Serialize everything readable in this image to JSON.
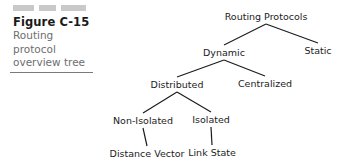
{
  "figure": {
    "title": "Figure C-15",
    "caption_lines": [
      "Routing",
      "protocol",
      "overview tree"
    ],
    "decor_bars": 3,
    "title_color": "#1a1a1a",
    "caption_color": "#6e6e6e",
    "bar_color": "#c9c9c9",
    "rule_color": "#7a7a7a"
  },
  "diagram": {
    "type": "tree",
    "line_color": "#1c1c1c",
    "node_text_color": "#1c1c1c",
    "nodes": [
      {
        "id": "root",
        "label": "Routing Protocols",
        "x": 266,
        "y": 11
      },
      {
        "id": "dynamic",
        "label": "Dynamic",
        "x": 224,
        "y": 47
      },
      {
        "id": "static",
        "label": "Static",
        "x": 318,
        "y": 45
      },
      {
        "id": "distributed",
        "label": "Distributed",
        "x": 177,
        "y": 79
      },
      {
        "id": "centralized",
        "label": "Centralized",
        "x": 265,
        "y": 78
      },
      {
        "id": "non-isolated",
        "label": "Non-Isolated",
        "x": 143,
        "y": 115
      },
      {
        "id": "isolated",
        "label": "Isolated",
        "x": 211,
        "y": 114
      },
      {
        "id": "distance-vector",
        "label": "Distance Vector",
        "x": 147,
        "y": 148
      },
      {
        "id": "link-state",
        "label": "Link State",
        "x": 212,
        "y": 147
      }
    ],
    "edges": [
      {
        "from": "root",
        "to": "dynamic"
      },
      {
        "from": "root",
        "to": "static"
      },
      {
        "from": "dynamic",
        "to": "distributed"
      },
      {
        "from": "dynamic",
        "to": "centralized"
      },
      {
        "from": "distributed",
        "to": "non-isolated"
      },
      {
        "from": "distributed",
        "to": "isolated"
      },
      {
        "from": "non-isolated",
        "to": "distance-vector"
      },
      {
        "from": "isolated",
        "to": "link-state"
      }
    ]
  }
}
